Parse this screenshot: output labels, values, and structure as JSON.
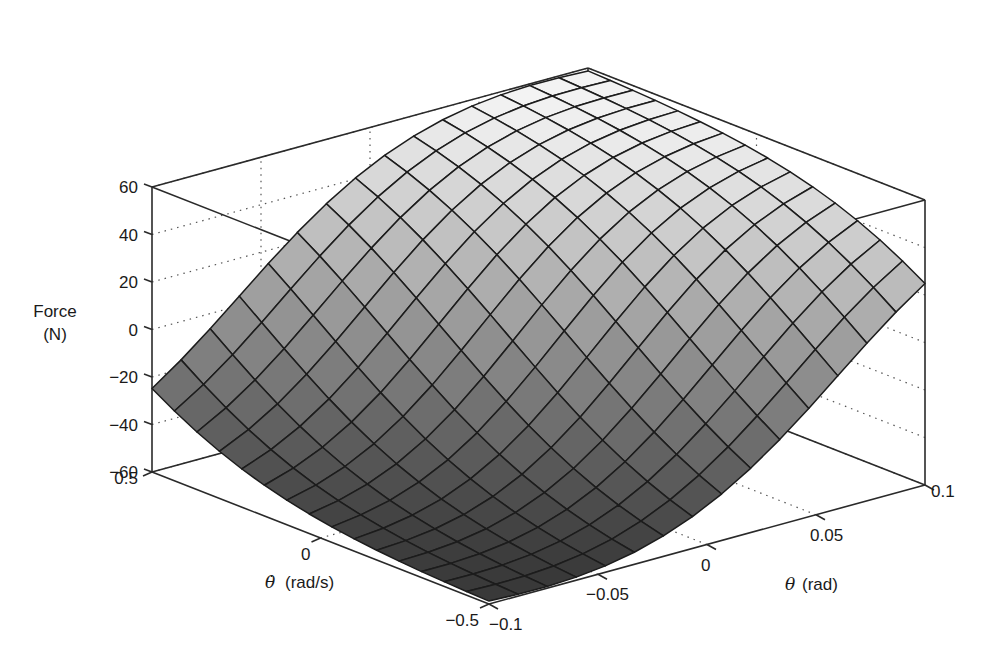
{
  "chart_data": {
    "type": "surface3d",
    "title": "",
    "zlabel_line1": "Force",
    "zlabel_line2": "(N)",
    "xlabel": "θ (rad)",
    "ylabel": "θ̇ (rad/s)",
    "xlabel_symbol": "θ",
    "xlabel_unit": "(rad)",
    "ylabel_symbol": "θ̇",
    "ylabel_unit": "(rad/s)",
    "x_range": [
      -0.1,
      0.1
    ],
    "y_range": [
      -0.5,
      0.5
    ],
    "z_range": [
      -60,
      60
    ],
    "x_ticks": [
      "−0.1",
      "−0.05",
      "0",
      "0.05",
      "0.1"
    ],
    "y_ticks": [
      "−0.5",
      "0",
      "0.5"
    ],
    "z_ticks": [
      "60",
      "40",
      "20",
      "0",
      "−20",
      "−40",
      "−60"
    ],
    "grid": "dotted",
    "mesh_resolution": [
      15,
      15
    ],
    "surface_description": "Saturated fuzzy-control surface: Force rises to +60 N (clipped) where θ and θ̇ are both large positive-ish toward the back, falls to −60 N (clipped) at the front corner (θ=−0.1, θ̇=−0.5); approximately 0 N along the anti-diagonal; ~+17 N at left corner (θ=−0.1, θ̇=0.5) and ~−27 N at right corner (θ=0.1, θ̇=−0.5).",
    "corner_values": {
      "theta_-0.1__thetadot_0.5": 17,
      "theta_-0.1__thetadot_-0.5": -60,
      "theta_0.1__thetadot_-0.5": -27,
      "theta_0.1__thetadot_0.5": 60
    },
    "colors": {
      "high": "#f4f4f4",
      "low": "#2e2e2e",
      "mesh_line": "#1c1c1c",
      "box_line": "#2a2a2a"
    }
  }
}
